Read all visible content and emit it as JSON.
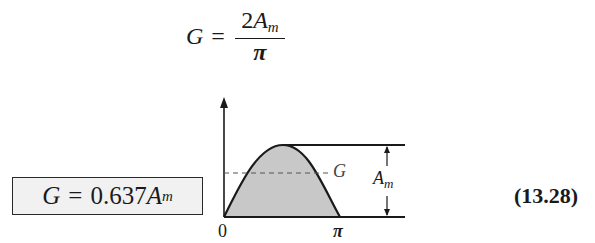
{
  "top_equation": {
    "lhs": "G",
    "equals": "=",
    "numerator_coeff": "2",
    "numerator_var": "A",
    "numerator_sub": "m",
    "denominator": "π"
  },
  "boxed_equation": {
    "lhs": "G",
    "equals": "=",
    "coeff": "0.637",
    "var": "A",
    "sub": "m"
  },
  "equation_number": "(13.28)",
  "figure": {
    "x_origin_label": "0",
    "x_pi_label": "π",
    "dashed_level_label": "G",
    "amplitude_label_var": "A",
    "amplitude_label_sub": "m",
    "fill_color": "#c8c8c8",
    "line_color": "#1a1a1a"
  }
}
